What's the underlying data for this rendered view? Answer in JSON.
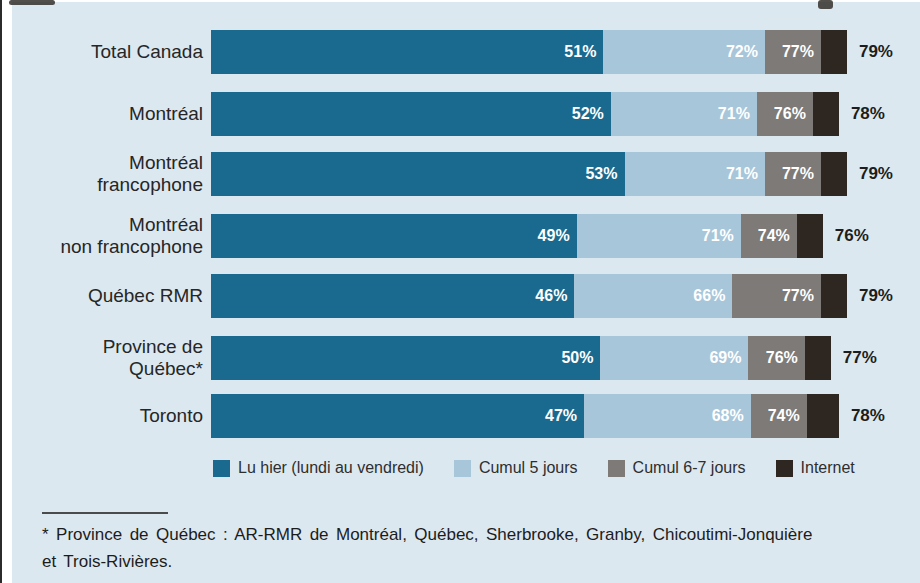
{
  "chart_data": {
    "type": "bar",
    "variant": "horizontal-stacked-cumulative",
    "categories": [
      "Total Canada",
      "Montréal",
      "Montréal\nfrancophone",
      "Montréal\nnon francophone",
      "Québec RMR",
      "Province de\nQuébec*",
      "Toronto"
    ],
    "series": [
      {
        "name": "Lu hier (lundi au vendredi)",
        "color": "#1a6a90",
        "values": [
          51,
          52,
          53,
          49,
          46,
          50,
          47
        ]
      },
      {
        "name": "Cumul 5 jours",
        "color": "#a8c6da",
        "values": [
          72,
          71,
          71,
          71,
          66,
          69,
          68
        ]
      },
      {
        "name": "Cumul 6-7 jours",
        "color": "#7d7a78",
        "values": [
          77,
          76,
          77,
          74,
          77,
          76,
          74
        ]
      },
      {
        "name": "Internet",
        "color": "#2e2620",
        "values": [
          79,
          78,
          79,
          76,
          79,
          77,
          78
        ]
      }
    ],
    "values_are_cumulative": true,
    "value_suffix": "%",
    "xlim": [
      0,
      82
    ],
    "grid": false,
    "legend_position": "bottom",
    "background_color": "#dce8f0"
  },
  "footnote": {
    "lines": [
      "* Province de Québec : AR-RMR de Montréal, Québec, Sherbrooke, Granby, Chicoutimi-Jonquière",
      "et Trois-Rivières."
    ]
  }
}
